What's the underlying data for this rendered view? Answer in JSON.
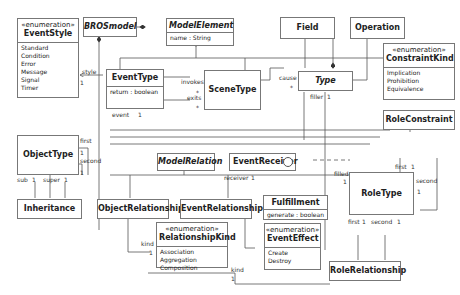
{
  "diagram": {
    "type": "UML class diagram",
    "classes": {
      "event_style": {
        "stereotype": "«enumeration»",
        "name": "EventStyle",
        "literals": [
          "Standard",
          "Condition",
          "Error",
          "Message",
          "Signal",
          "Timer"
        ]
      },
      "bros_model": {
        "name": "BROSmodel",
        "abstract": true
      },
      "model_element": {
        "name": "ModelElement",
        "abstract": true,
        "attributes": [
          "name : String"
        ]
      },
      "field": {
        "name": "Field"
      },
      "operation": {
        "name": "Operation"
      },
      "constraint_kind": {
        "stereotype": "«enumeration»",
        "name": "ConstraintKind",
        "literals": [
          "Implication",
          "Prohibition",
          "Equivalence"
        ]
      },
      "event_type": {
        "name": "EventType",
        "attributes": [
          "return : boolean"
        ]
      },
      "scene_type": {
        "name": "SceneType"
      },
      "type": {
        "name": "Type",
        "abstract": true
      },
      "role_constraint": {
        "name": "RoleConstraint"
      },
      "object_type": {
        "name": "ObjectType"
      },
      "model_relation": {
        "name": "ModelRelation",
        "abstract": true
      },
      "event_receiver": {
        "name": "EventReceiver"
      },
      "fulfillment": {
        "name": "Fulfillment",
        "attributes": [
          "generate : boolean"
        ]
      },
      "role_type": {
        "name": "RoleType"
      },
      "inheritance": {
        "name": "Inheritance"
      },
      "object_relationship": {
        "name": "ObjectRelationship"
      },
      "event_relationship": {
        "name": "EventRelationship"
      },
      "relationship_kind": {
        "stereotype": "«enumeration»",
        "name": "RelationshipKind",
        "literals": [
          "Association",
          "Aggregation",
          "Composition"
        ]
      },
      "event_effect": {
        "stereotype": "«enumeration»",
        "name": "EventEffect",
        "literals": [
          "Create",
          "Destroy"
        ]
      },
      "role_relationship": {
        "name": "RoleRelationship"
      }
    },
    "labels": {
      "style": "style",
      "style_mult": "1",
      "invokes": "invokes",
      "invokes_mult": "*",
      "exits": "exits",
      "exits_mult": "*",
      "event": "event",
      "event_mult": "1",
      "cause": "cause",
      "cause_mult": "*",
      "filler": "filler",
      "filler_mult": "1",
      "first_ot": "first",
      "first_ot_mult": "1",
      "second_ot": "second",
      "second_ot_mult": "1",
      "sub": "sub",
      "sub_mult": "1",
      "super": "super",
      "super_mult": "1",
      "receiver": "receiver",
      "receiver_mult": "1",
      "filled": "filled",
      "filled_mult": "1",
      "first_rc": "first",
      "first_rc_mult": "1",
      "second_rc": "second",
      "second_rc_mult": "1",
      "first_rr": "first",
      "first_rr_mult": "1",
      "second_rr": "second",
      "second_rr_mult": "1",
      "kind_or": "kind",
      "kind_or_mult": "1",
      "kind_rr": "kind",
      "kind_rr_mult": "1"
    }
  }
}
